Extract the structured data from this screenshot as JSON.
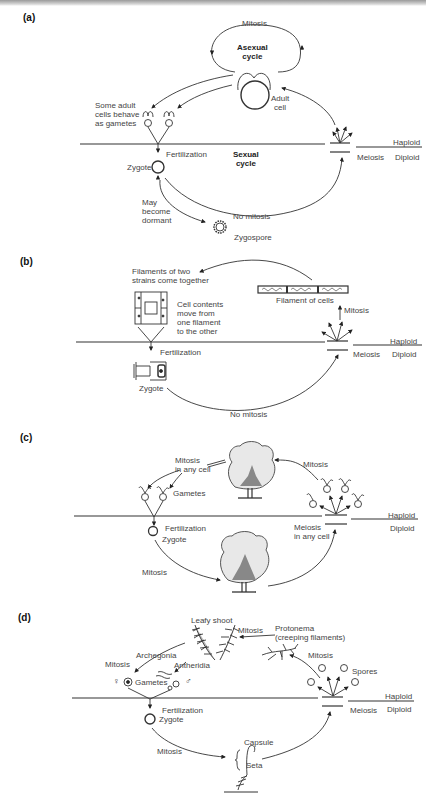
{
  "panels": {
    "a": {
      "label": "(a)",
      "mitosis": "Mitosis",
      "asexual_cycle": [
        "Asexual",
        "cycle"
      ],
      "adult_cell": [
        "Adult",
        "cell"
      ],
      "gametes_note": [
        "Some adult",
        "cells behave",
        "as gametes"
      ],
      "fertilization": "Fertilization",
      "sexual_cycle": [
        "Sexual",
        "cycle"
      ],
      "zygote": "Zygote",
      "meiosis": "Meiosis",
      "haploid": "Haploid",
      "diploid": "Diploid",
      "dormant": [
        "May",
        "become",
        "dormant"
      ],
      "no_mitosis": "No mitosis",
      "zygospore": "Zygospore"
    },
    "b": {
      "label": "(b)",
      "filaments_note": [
        "Filaments of two",
        "strains come together"
      ],
      "filament_of_cells": "Filament of cells",
      "cell_contents": [
        "Cell contents",
        "move from",
        "one filament",
        "to the other"
      ],
      "mitosis": "Mitosis",
      "fertilization": "Fertilization",
      "zygote": "Zygote",
      "meiosis": "Meiosis",
      "haploid": "Haploid",
      "diploid": "Diploid",
      "no_mitosis": "No mitosis"
    },
    "c": {
      "label": "(c)",
      "mitosis_any_cell": [
        "Mitosis",
        "in any cell"
      ],
      "mitosis_top": "Mitosis",
      "gametes": "Gametes",
      "fertilization": "Fertilization",
      "zygote": "Zygote",
      "meiosis_any_cell": [
        "Meiosis",
        "in any cell"
      ],
      "haploid": "Haploid",
      "diploid": "Diploid",
      "mitosis_bottom": "Mitosis"
    },
    "d": {
      "label": "(d)",
      "leafy_shoot": "Leafy shoot",
      "mitosis_top": "Mitosis",
      "protonema": [
        "Protonema",
        "(creeping filaments)"
      ],
      "mitosis_spores": "Mitosis",
      "archegonia": "Archegonia",
      "antheridia": "Antheridia",
      "mitosis_left": "Mitosis",
      "female_symbol": "♀",
      "male_symbol": "♂",
      "gametes": "Gametes",
      "spores": "Spores",
      "haploid": "Haploid",
      "diploid": "Diploid",
      "meiosis": "Meiosis",
      "fertilization": "Fertilization",
      "zygote": "Zygote",
      "mitosis_bottom": "Mitosis",
      "capsule": "Capsule",
      "seta": "Seta"
    }
  }
}
